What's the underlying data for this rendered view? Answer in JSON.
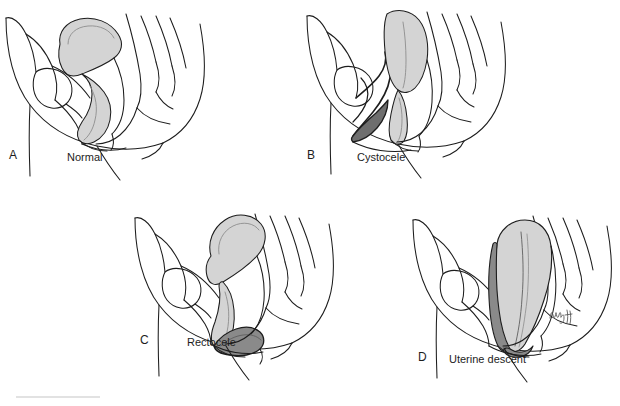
{
  "figure": {
    "background_color": "#ffffff",
    "line_color": "#1d1d1d",
    "label_color": "#1d1d1d",
    "shade_light": "#d4d4d4",
    "shade_mid": "#b5b5b5",
    "shade_dark": "#8a8a8a",
    "shade_darkest": "#6e6e6e",
    "panel_count": 4,
    "layout": "2x2 grid"
  },
  "panels": [
    {
      "letter": "A",
      "name": "Normal",
      "view": "midsagittal female pelvis",
      "shaded_organ": "uterus and vagina",
      "shade": "#d4d4d4",
      "has_prolapse_bulge": false
    },
    {
      "letter": "B",
      "name": "Cystocele",
      "view": "midsagittal female pelvis",
      "shaded_organ": "uterus and vagina",
      "shade": "#d4d4d4",
      "has_prolapse_bulge": true,
      "bulge_label": "bladder bulging into anterior vaginal wall",
      "bulge_shade": "#6e6e6e"
    },
    {
      "letter": "C",
      "name": "Rectocele",
      "view": "midsagittal female pelvis",
      "shaded_organ": "uterus and vagina",
      "shade": "#d4d4d4",
      "has_prolapse_bulge": true,
      "bulge_label": "rectum bulging into posterior vaginal wall",
      "bulge_shade": "#8a8a8a"
    },
    {
      "letter": "D",
      "name": "Uterine descent",
      "view": "midsagittal female pelvis",
      "shaded_organ": "descended uterus and vagina",
      "shade": "#d4d4d4",
      "has_prolapse_bulge": true,
      "bulge_label": "uterus descending into vaginal canal",
      "bulge_shade": "#8a8a8a"
    }
  ],
  "signature": {
    "present": true,
    "description": "handwritten artist initials",
    "panel": "D"
  },
  "footer": {
    "rule_color": "#e2e2e2",
    "rule_present": true
  }
}
